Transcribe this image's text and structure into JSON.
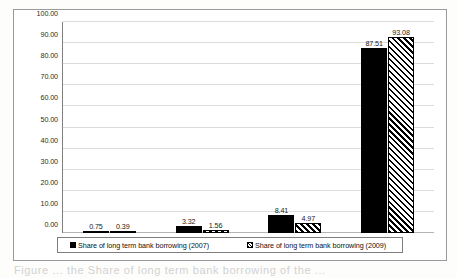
{
  "chart_data": {
    "type": "bar",
    "title": "",
    "xlabel": "",
    "ylabel": "",
    "categories": [
      "Q1",
      "Q2",
      "Q3",
      "Q4"
    ],
    "series": [
      {
        "name": "Share of long term bank borrowing (2007)",
        "pattern": "solid-black",
        "values": [
          0.75,
          3.32,
          8.41,
          87.51
        ],
        "labels": [
          "0.75",
          "3.32",
          "8.41",
          "87.51"
        ]
      },
      {
        "name": "Share of long term bank borrowing (2009)",
        "pattern": "diagonal-hatch",
        "values": [
          0.39,
          1.56,
          4.97,
          93.08
        ],
        "labels": [
          "0.39",
          "1.56",
          "4.97",
          "93.08"
        ]
      }
    ],
    "ylim": [
      0,
      100
    ],
    "yticks": [
      0,
      10,
      20,
      30,
      40,
      50,
      60,
      70,
      80,
      90,
      100
    ],
    "ytick_labels": [
      "0.00",
      "10.00",
      "20.00",
      "30.00",
      "40.00",
      "50.00",
      "60.00",
      "70.00",
      "80.00",
      "90.00",
      "100.00"
    ],
    "grid": true,
    "legend_position": "bottom",
    "colors": {
      "series0": "#000000",
      "series1_fill": "#ffffff",
      "series1_hatch": "#000000",
      "gridline": "#dcdcdc",
      "axis": "#808080",
      "frame": "#9a9a9a",
      "text": "#1a1a1a"
    }
  },
  "legend": {
    "entries": [
      "Share of long term bank borrowing (2007)",
      "Share of long term bank borrowing (2009)"
    ]
  },
  "page": {
    "caption_fragment": "Figure ... the Share of long term bank borrowing of the ..."
  }
}
